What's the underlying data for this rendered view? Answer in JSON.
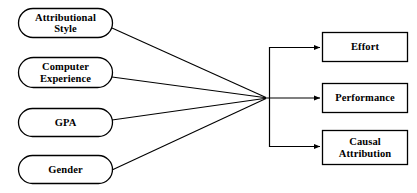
{
  "diagram": {
    "type": "path-diagram",
    "background_color": "#ffffff",
    "stroke_color": "#000000",
    "text_color": "#000000",
    "predictors": [
      {
        "id": "attributional-style",
        "label": "Attributional\nStyle",
        "shape": "stadium",
        "x": 18,
        "y": 8,
        "width": 95,
        "height": 30
      },
      {
        "id": "computer-experience",
        "label": "Computer\nExperience",
        "shape": "stadium",
        "x": 18,
        "y": 57,
        "width": 95,
        "height": 31
      },
      {
        "id": "gpa",
        "label": "GPA",
        "shape": "stadium",
        "x": 18,
        "y": 108,
        "width": 95,
        "height": 29
      },
      {
        "id": "gender",
        "label": "Gender",
        "shape": "stadium",
        "x": 18,
        "y": 155,
        "width": 95,
        "height": 29
      }
    ],
    "outcomes": [
      {
        "id": "effort",
        "label": "Effort",
        "shape": "rectangle",
        "x": 322,
        "y": 32,
        "width": 86,
        "height": 30
      },
      {
        "id": "performance",
        "label": "Performance",
        "shape": "rectangle",
        "x": 322,
        "y": 83,
        "width": 86,
        "height": 30
      },
      {
        "id": "causal-attribution",
        "label": "Causal\nAttribution",
        "shape": "rectangle",
        "x": 322,
        "y": 130,
        "width": 86,
        "height": 35
      }
    ],
    "convergence_point": {
      "x": 266,
      "y": 98
    },
    "bus": {
      "x": 270,
      "top_y": 47,
      "bottom_y": 147
    },
    "connectors": [
      {
        "from": "attributional-style",
        "to": "convergence",
        "arrow": false
      },
      {
        "from": "computer-experience",
        "to": "convergence",
        "arrow": false
      },
      {
        "from": "gpa",
        "to": "convergence",
        "arrow": false
      },
      {
        "from": "gender",
        "to": "convergence",
        "arrow": false
      },
      {
        "from": "convergence",
        "to": "effort",
        "arrow": true
      },
      {
        "from": "convergence",
        "to": "performance",
        "arrow": true
      },
      {
        "from": "convergence",
        "to": "causal-attribution",
        "arrow": true
      }
    ]
  }
}
